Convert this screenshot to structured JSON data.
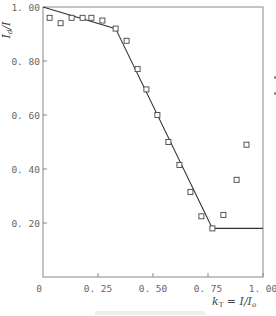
{
  "chart_data": {
    "type": "scatter",
    "title": "",
    "xlabel": "k_T = I/I_o",
    "ylabel": "I_d/I",
    "xlim": [
      0,
      1.0
    ],
    "ylim": [
      0,
      1.0
    ],
    "grid": false,
    "legend": null,
    "x_ticks": [
      "0",
      "0.25",
      "0.50",
      "0.75",
      "1.00"
    ],
    "y_ticks": [
      "0.20",
      "0.40",
      "0.60",
      "0.80",
      "1.00"
    ],
    "series": [
      {
        "name": "measured",
        "marker": "open-square",
        "points": [
          [
            0.03,
            0.96
          ],
          [
            0.08,
            0.94
          ],
          [
            0.13,
            0.96
          ],
          [
            0.18,
            0.96
          ],
          [
            0.22,
            0.96
          ],
          [
            0.27,
            0.95
          ],
          [
            0.33,
            0.92
          ],
          [
            0.38,
            0.875
          ],
          [
            0.43,
            0.77
          ],
          [
            0.47,
            0.695
          ],
          [
            0.52,
            0.6
          ],
          [
            0.57,
            0.5
          ],
          [
            0.62,
            0.415
          ],
          [
            0.67,
            0.315
          ],
          [
            0.72,
            0.225
          ],
          [
            0.77,
            0.18
          ],
          [
            0.82,
            0.23
          ],
          [
            0.88,
            0.36
          ],
          [
            0.925,
            0.49
          ]
        ]
      },
      {
        "name": "correlation",
        "style": "line",
        "points": [
          [
            0.0,
            1.0
          ],
          [
            0.33,
            0.92
          ],
          [
            0.77,
            0.18
          ],
          [
            1.0,
            0.18
          ]
        ]
      }
    ]
  },
  "labels": {
    "x_axis_main": "k",
    "x_axis_sub": "T",
    "x_axis_rest": " = I/I",
    "x_axis_rest_sub": "o",
    "y_axis_main": "I",
    "y_axis_sub": "d",
    "y_axis_rest": "/I",
    "origin": "0"
  }
}
